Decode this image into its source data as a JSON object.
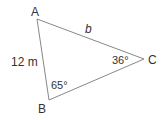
{
  "diagram": {
    "type": "triangle",
    "stroke_color": "#888888",
    "text_color": "#333333",
    "vertices": {
      "A": {
        "label": "A",
        "x": 37,
        "y": 19
      },
      "B": {
        "label": "B",
        "x": 49,
        "y": 100
      },
      "C": {
        "label": "C",
        "x": 144,
        "y": 59
      }
    },
    "sides": {
      "AB": {
        "label": "12 m"
      },
      "AC": {
        "label": "b"
      }
    },
    "angles": {
      "B": {
        "label": "65°"
      },
      "C": {
        "label": "36°"
      }
    }
  }
}
